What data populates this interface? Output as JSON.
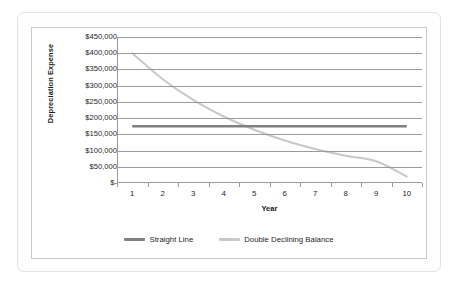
{
  "chart_data": {
    "type": "line",
    "title": "",
    "xlabel": "Year",
    "ylabel": "Depreciation Expense",
    "categories": [
      "1",
      "2",
      "3",
      "4",
      "5",
      "6",
      "7",
      "8",
      "9",
      "10"
    ],
    "ylim": [
      0,
      450000
    ],
    "ytick_values": [
      450000,
      400000,
      350000,
      300000,
      250000,
      200000,
      150000,
      100000,
      50000,
      0
    ],
    "ytick_labels": [
      "$450,000",
      "$400,000",
      "$350,000",
      "$300,000",
      "$250,000",
      "$200,000",
      "$150,000",
      "$100,000",
      "$50,000",
      "$-"
    ],
    "grid": true,
    "grid_axis": "y",
    "legend_position": "bottom",
    "smooth": true,
    "series": [
      {
        "name": "Straight Line",
        "color": "#808080",
        "width": 2.4,
        "values": [
          175000,
          175000,
          175000,
          175000,
          175000,
          175000,
          175000,
          175000,
          175000,
          175000
        ]
      },
      {
        "name": "Double Declining Balance",
        "color": "#c8c8c8",
        "width": 2.0,
        "values": [
          400000,
          320000,
          256000,
          205000,
          164000,
          131000,
          105000,
          84000,
          67000,
          20000
        ]
      }
    ]
  }
}
